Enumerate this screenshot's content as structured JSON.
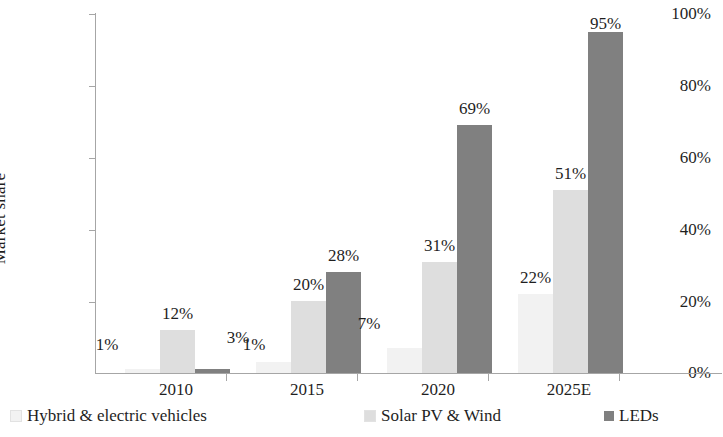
{
  "chart_data": {
    "type": "bar",
    "title": "",
    "subtitle": "",
    "xlabel": "",
    "ylabel": "Market share",
    "categories": [
      "2010",
      "2015",
      "2020",
      "2025E"
    ],
    "series": [
      {
        "name": "Hybrid & electric vehicles",
        "color": "#f2f2f2",
        "values": [
          1,
          3,
          7,
          22
        ],
        "labels": [
          "1%",
          "3%",
          "7%",
          "22%"
        ]
      },
      {
        "name": "Solar PV & Wind",
        "color": "#dedede",
        "values": [
          12,
          20,
          31,
          51
        ],
        "labels": [
          "12%",
          "20%",
          "31%",
          "51%"
        ]
      },
      {
        "name": "LEDs",
        "color": "#808080",
        "values": [
          1,
          28,
          69,
          95
        ],
        "labels": [
          "1%",
          "28%",
          "69%",
          "95%"
        ]
      }
    ],
    "ylim": [
      0,
      100
    ],
    "y_ticks": [
      0,
      20,
      40,
      60,
      80,
      100
    ],
    "y_tick_labels": [
      "0%",
      "20%",
      "40%",
      "60%",
      "80%",
      "100%"
    ],
    "grid": false,
    "legend_position": "bottom",
    "value_format": "percent"
  },
  "axis": {
    "y_title": "Market share",
    "tick_labels": [
      "100%",
      "80%",
      "60%",
      "40%",
      "20%",
      "0%"
    ],
    "category_labels": [
      "2010",
      "2015",
      "2020",
      "2025E"
    ]
  },
  "legend": {
    "items": [
      {
        "label": "Hybrid & electric vehicles",
        "color": "#f2f2f2"
      },
      {
        "label": "Solar PV & Wind",
        "color": "#dedede"
      },
      {
        "label": "LEDs",
        "color": "#808080"
      }
    ]
  },
  "colors": {
    "axis": "#a6a6a6",
    "text": "#1f1f1f",
    "background": "#ffffff"
  }
}
